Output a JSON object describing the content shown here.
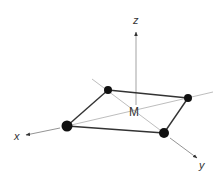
{
  "diagram": {
    "center_label": "M",
    "axes": [
      {
        "name": "x",
        "label": "x"
      },
      {
        "name": "y",
        "label": "y"
      },
      {
        "name": "z",
        "label": "z"
      }
    ],
    "ligands": [
      {
        "id": "L1",
        "position": "top-left"
      },
      {
        "id": "L2",
        "position": "right"
      },
      {
        "id": "L3",
        "position": "bottom"
      },
      {
        "id": "L4",
        "position": "left"
      }
    ],
    "colors": {
      "ligand": "#111111",
      "edge": "#333333",
      "axis": "#b0b0b0",
      "axis_arrow": "#444444",
      "text": "#333333"
    }
  }
}
